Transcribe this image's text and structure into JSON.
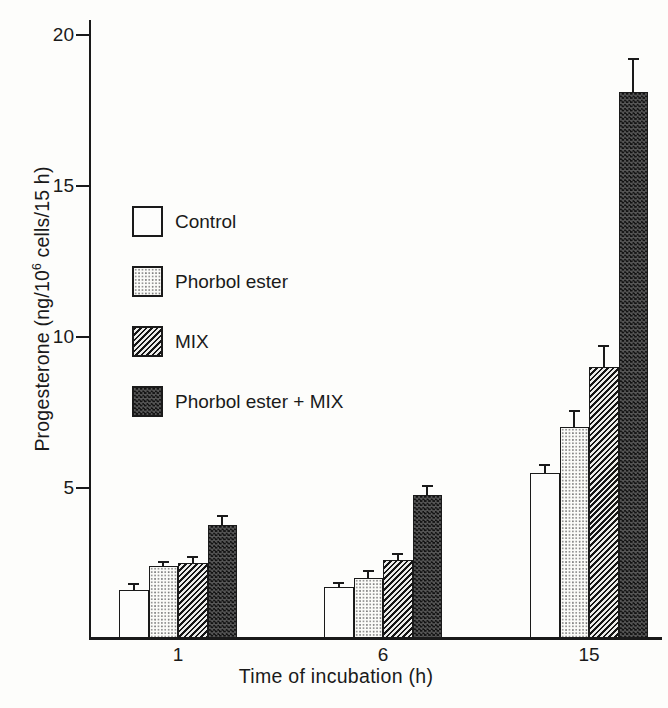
{
  "figure": {
    "background": "#fdfdfb",
    "ink": "#1a1a1a"
  },
  "chart_data": {
    "type": "bar",
    "title": "",
    "xlabel": "Time of incubation (h)",
    "ylabel": "Progesterone (ng/10⁶ cells/15 h)",
    "ylabel_parts": {
      "prefix": "Progesterone (ng/10",
      "sup": "6",
      "suffix": " cells/15 h)"
    },
    "categories": [
      "1",
      "6",
      "15"
    ],
    "yticks": [
      5,
      10,
      15,
      20
    ],
    "ylim": [
      0,
      20.5
    ],
    "grid": false,
    "error_bars": "upper only",
    "legend_position": "upper-left-inside",
    "series": [
      {
        "name": "Control",
        "pattern": "open",
        "values": [
          1.6,
          1.7,
          5.5
        ],
        "errors_plus": [
          0.2,
          0.15,
          0.25
        ]
      },
      {
        "name": "Phorbol ester",
        "pattern": "stipple",
        "values": [
          2.4,
          2.0,
          7.0
        ],
        "errors_plus": [
          0.15,
          0.25,
          0.55
        ]
      },
      {
        "name": "MIX",
        "pattern": "hatch",
        "values": [
          2.5,
          2.6,
          9.0
        ],
        "errors_plus": [
          0.2,
          0.2,
          0.7
        ]
      },
      {
        "name": "Phorbol ester + MIX",
        "pattern": "dark-check",
        "values": [
          3.75,
          4.75,
          18.1
        ],
        "errors_plus": [
          0.3,
          0.3,
          1.1
        ]
      }
    ]
  }
}
